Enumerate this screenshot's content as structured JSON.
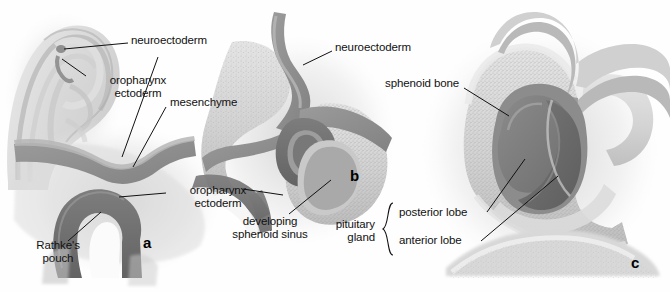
{
  "figure": {
    "width": 670,
    "height": 292,
    "background": "#fefefe",
    "style": "grayscale medical illustration"
  },
  "palette": {
    "ink": "#111111",
    "leader_line": "#111111",
    "bone_light": "#dcdcdc",
    "bone_mid": "#c8c8c8",
    "bone_stipple": "#b4b4b4",
    "neuroectoderm": "#8e8e8e",
    "ectoderm_dark": "#6f6f6f",
    "lumen_white": "#fbfbfb",
    "soft_tissue": "#a5a5a5",
    "shadow": "#9a9a9a",
    "posterior_lobe": "#7a7a7a",
    "anterior_lobe": "#6a6a6a"
  },
  "panels": [
    {
      "id": "a",
      "letter": "a",
      "x": 148,
      "y": 243
    },
    {
      "id": "b",
      "letter": "b",
      "x": 355,
      "y": 176
    },
    {
      "id": "c",
      "letter": "c",
      "x": 636,
      "y": 263
    }
  ],
  "labels": [
    {
      "id": "neuroectoderm-embryo",
      "text": "neuroectoderm",
      "x": 131,
      "y": 40,
      "align": "left",
      "panel": "embryo"
    },
    {
      "id": "oropharynx-ectoderm-embryo",
      "lines": [
        "oropharynx",
        "ectoderm"
      ],
      "x": 90,
      "y": 82,
      "align": "left",
      "panel": "embryo"
    },
    {
      "id": "mesenchyme",
      "text": "mesenchyme",
      "x": 170,
      "y": 102,
      "align": "left",
      "panel": "a"
    },
    {
      "id": "oropharynx-ectoderm-a",
      "lines": [
        "oropharynx",
        "ectoderm"
      ],
      "x": 170,
      "y": 190,
      "align": "left",
      "panel": "a"
    },
    {
      "id": "rathkes-pouch",
      "lines": [
        "Rathke's",
        "pouch"
      ],
      "x": 28,
      "y": 245,
      "align": "left",
      "panel": "a"
    },
    {
      "id": "neuroectoderm-b",
      "text": "neuroectoderm",
      "x": 335,
      "y": 47,
      "align": "left",
      "panel": "b"
    },
    {
      "id": "developing-sphenoid-sinus",
      "lines": [
        "developing",
        "sphenoid sinus"
      ],
      "x": 270,
      "y": 221,
      "align": "center",
      "panel": "b"
    },
    {
      "id": "sphenoid-bone",
      "text": "sphenoid bone",
      "x": 385,
      "y": 83,
      "align": "left",
      "panel": "c"
    },
    {
      "id": "pituitary-gland",
      "lines": [
        "pituitary",
        "gland"
      ],
      "x": 375,
      "y": 224,
      "align": "right",
      "panel": "c"
    },
    {
      "id": "posterior-lobe",
      "text": "posterior lobe",
      "x": 399,
      "y": 212,
      "align": "left",
      "panel": "c"
    },
    {
      "id": "anterior-lobe",
      "text": "anterior lobe",
      "x": 399,
      "y": 240,
      "align": "left",
      "panel": "c"
    }
  ],
  "brace": {
    "id": "pituitary-gland-brace",
    "x": 389,
    "y_top": 203,
    "y_bottom": 255
  },
  "leaders": [
    {
      "id": "leader-neuroectoderm-embryo",
      "from": [
        128,
        43
      ],
      "to": [
        62,
        48
      ]
    },
    {
      "id": "leader-oropharynx-ectoderm-embryo",
      "from": [
        86,
        76
      ],
      "to": [
        62,
        60
      ]
    },
    {
      "id": "leader-mesenchyme",
      "from": [
        167,
        106
      ],
      "to": [
        133,
        166
      ]
    },
    {
      "id": "leader-neuroectoderm-a",
      "from": [
        158,
        56
      ],
      "to": [
        122,
        158
      ]
    },
    {
      "id": "leader-oropharynx-ectoderm-a",
      "from": [
        167,
        193
      ],
      "to": [
        120,
        196
      ]
    },
    {
      "id": "leader-rathkes-pouch",
      "from": [
        68,
        240
      ],
      "to": [
        100,
        213
      ]
    },
    {
      "id": "leader-neuroectoderm-b",
      "from": [
        332,
        51
      ],
      "to": [
        305,
        64
      ]
    },
    {
      "id": "leader-developing-sphenoid-sinus",
      "from": [
        288,
        214
      ],
      "to": [
        330,
        180
      ]
    },
    {
      "id": "leader-oropharynx-ectoderm-b",
      "from": [
        244,
        189
      ],
      "to": [
        282,
        194
      ]
    },
    {
      "id": "leader-sphenoid-bone",
      "from": [
        465,
        87
      ],
      "to": [
        508,
        115
      ]
    },
    {
      "id": "leader-posterior-lobe",
      "from": [
        487,
        213
      ],
      "to": [
        524,
        160
      ]
    },
    {
      "id": "leader-anterior-lobe",
      "from": [
        480,
        242
      ],
      "to": [
        557,
        175
      ]
    }
  ]
}
